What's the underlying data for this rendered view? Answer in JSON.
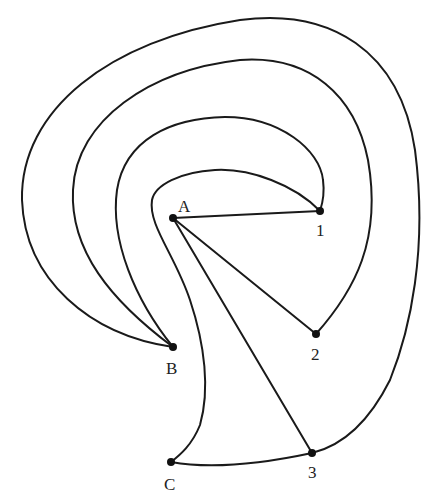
{
  "diagram": {
    "type": "graph-with-curved-edges",
    "nodes": [
      {
        "id": "A",
        "label": "A",
        "x": 173,
        "y": 218,
        "label_x": 178,
        "label_y": 212
      },
      {
        "id": "1",
        "label": "1",
        "x": 320,
        "y": 211,
        "label_x": 316,
        "label_y": 236
      },
      {
        "id": "2",
        "label": "2",
        "x": 316,
        "y": 334,
        "label_x": 311,
        "label_y": 360
      },
      {
        "id": "B",
        "label": "B",
        "x": 173,
        "y": 347,
        "label_x": 166,
        "label_y": 374
      },
      {
        "id": "C",
        "label": "C",
        "x": 171,
        "y": 462,
        "label_x": 164,
        "label_y": 490
      },
      {
        "id": "3",
        "label": "3",
        "x": 312,
        "y": 453,
        "label_x": 308,
        "label_y": 478
      }
    ],
    "straight_edges": [
      {
        "from": "A",
        "to": "1"
      },
      {
        "from": "A",
        "to": "2"
      },
      {
        "from": "A",
        "to": "3"
      }
    ],
    "curved_edges": [
      {
        "from": "B",
        "to": "3",
        "description": "outermost arc"
      },
      {
        "from": "B",
        "to": "2",
        "description": "second arc"
      },
      {
        "from": "B",
        "to": "1",
        "description": "third arc"
      },
      {
        "from": "1",
        "to": "C",
        "description": "innermost arc around A"
      },
      {
        "from": "C",
        "to": "3",
        "description": "bottom edge"
      }
    ],
    "colors": {
      "stroke": "#1a1a1a",
      "node": "#111111",
      "background": "#ffffff"
    }
  }
}
